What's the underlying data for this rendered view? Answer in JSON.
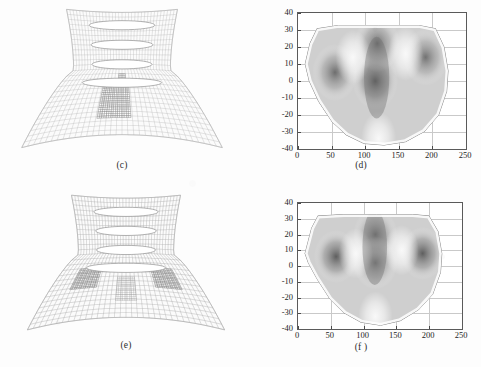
{
  "figure": {
    "panels": [
      {
        "id": "c",
        "caption": "(c)",
        "type": "mesh",
        "description": "finite element mesh, flared axisymmetric section with four lens-shaped voids"
      },
      {
        "id": "d",
        "caption": "(d)",
        "type": "contour",
        "description": "grayscale contour field plot"
      },
      {
        "id": "e",
        "caption": "(e)",
        "type": "mesh",
        "description": "finite element mesh, deformed with darker stress concentration zones"
      },
      {
        "id": "f",
        "caption": "(f )",
        "type": "contour",
        "description": "grayscale contour field plot"
      }
    ]
  },
  "chart_data": [
    {
      "panel": "d",
      "type": "heatmap",
      "title": "",
      "xlabel": "",
      "ylabel": "",
      "xlim": [
        0,
        250
      ],
      "ylim": [
        -40,
        40
      ],
      "xticks": [
        0,
        50,
        100,
        150,
        200,
        250
      ],
      "yticks": [
        -40,
        -30,
        -20,
        -10,
        0,
        10,
        20,
        30,
        40
      ],
      "xticklabels": [
        "0",
        "50",
        "100",
        "150",
        "200",
        "250"
      ],
      "yticklabels": [
        "-40",
        "-30",
        "-20",
        "-10",
        "0",
        "10",
        "20",
        "30",
        "40"
      ],
      "grid": true,
      "legend": "none",
      "colormap": "grayscale",
      "domain_outline": [
        [
          10,
          10
        ],
        [
          17,
          22
        ],
        [
          28,
          31
        ],
        [
          60,
          33
        ],
        [
          120,
          33
        ],
        [
          180,
          33
        ],
        [
          205,
          31
        ],
        [
          218,
          20
        ],
        [
          224,
          6
        ],
        [
          222,
          -6
        ],
        [
          210,
          -20
        ],
        [
          188,
          -30
        ],
        [
          160,
          -36
        ],
        [
          128,
          -38
        ],
        [
          98,
          -37
        ],
        [
          72,
          -32
        ],
        [
          50,
          -24
        ],
        [
          30,
          -12
        ],
        [
          16,
          0
        ]
      ],
      "features": [
        {
          "name": "left-lobe-dark",
          "center": [
            55,
            5
          ],
          "intensity": 0.72
        },
        {
          "name": "central-stem-dark",
          "center": [
            115,
            0
          ],
          "intensity": 0.82
        },
        {
          "name": "central-top-dark",
          "center": [
            118,
            22
          ],
          "intensity": 0.72
        },
        {
          "name": "right-lobe-dark",
          "center": [
            190,
            14
          ],
          "intensity": 0.7
        },
        {
          "name": "light-band-left",
          "center": [
            82,
            14
          ],
          "intensity": 0.12
        },
        {
          "name": "light-band-right",
          "center": [
            160,
            16
          ],
          "intensity": 0.12
        },
        {
          "name": "light-rim-bottom",
          "center": [
            120,
            -34
          ],
          "intensity": 0.1
        }
      ]
    },
    {
      "panel": "f",
      "type": "heatmap",
      "title": "",
      "xlabel": "",
      "ylabel": "",
      "xlim": [
        0,
        250
      ],
      "ylim": [
        -40,
        40
      ],
      "xticks": [
        0,
        50,
        100,
        150,
        200,
        250
      ],
      "yticks": [
        -40,
        -30,
        -20,
        -10,
        0,
        10,
        20,
        30,
        40
      ],
      "xticklabels": [
        "0",
        "50",
        "100",
        "150",
        "200",
        "250"
      ],
      "yticklabels": [
        "-40",
        "-30",
        "-20",
        "-10",
        "0",
        "10",
        "20",
        "30",
        "40"
      ],
      "grid": true,
      "legend": "none",
      "colormap": "grayscale",
      "domain_outline": [
        [
          10,
          8
        ],
        [
          20,
          24
        ],
        [
          30,
          32
        ],
        [
          70,
          33
        ],
        [
          120,
          33
        ],
        [
          175,
          33
        ],
        [
          200,
          32
        ],
        [
          214,
          22
        ],
        [
          220,
          8
        ],
        [
          218,
          -4
        ],
        [
          206,
          -18
        ],
        [
          184,
          -28
        ],
        [
          156,
          -35
        ],
        [
          126,
          -38
        ],
        [
          96,
          -36
        ],
        [
          70,
          -30
        ],
        [
          48,
          -21
        ],
        [
          28,
          -8
        ],
        [
          15,
          2
        ]
      ],
      "features": [
        {
          "name": "left-lobe-dark",
          "center": [
            58,
            6
          ],
          "intensity": 0.8
        },
        {
          "name": "central-band-dark",
          "center": [
            118,
            20
          ],
          "intensity": 0.7
        },
        {
          "name": "central-stem-dark",
          "center": [
            118,
            2
          ],
          "intensity": 0.66
        },
        {
          "name": "right-lobe-dark",
          "center": [
            190,
            8
          ],
          "intensity": 0.8
        },
        {
          "name": "light-band-left",
          "center": [
            88,
            8
          ],
          "intensity": 0.1
        },
        {
          "name": "light-band-right",
          "center": [
            158,
            10
          ],
          "intensity": 0.12
        },
        {
          "name": "light-rim-bottom",
          "center": [
            118,
            -32
          ],
          "intensity": 0.08
        }
      ]
    }
  ]
}
